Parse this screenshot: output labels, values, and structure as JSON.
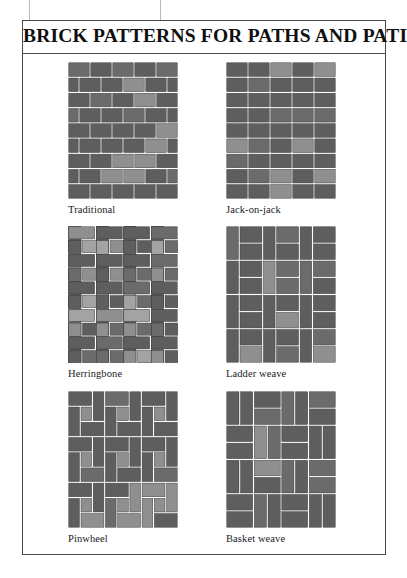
{
  "figure": {
    "title": "BRICK PATTERNS FOR PATHS AND PATIOS",
    "border_color": "#4a4a4a",
    "background_color": "#ffffff"
  },
  "palette": {
    "brick_dark": "#5e5e5e",
    "brick_mid": "#6b6b6b",
    "brick_light": "#8f8f8f",
    "brick_pale": "#a3a3a3",
    "mortar": "#ffffff",
    "brick_outline": "#3c3c3c",
    "label_text": "#1a1a1a",
    "title_text": "#101010"
  },
  "patterns": [
    {
      "id": "traditional",
      "label": "Traditional",
      "type": "running-bond",
      "columns": 5,
      "rows": 9,
      "description": "Half-lap running bond; each course offset by half a brick."
    },
    {
      "id": "jack-on-jack",
      "label": "Jack-on-jack",
      "type": "stack-bond",
      "columns": 5,
      "rows": 9,
      "description": "Stacked bond; bricks aligned in straight columns and rows."
    },
    {
      "id": "herringbone",
      "label": "Herringbone",
      "type": "herringbone",
      "unit_bricks": 2,
      "description": "Bricks laid at right angles in an interlocking zigzag."
    },
    {
      "id": "ladder-weave",
      "label": "Ladder weave",
      "type": "ladder-weave",
      "columns": 3,
      "rows": 4,
      "description": "Single vertical brick alternating with two stacked horizontal bricks."
    },
    {
      "id": "pinwheel",
      "label": "Pinwheel",
      "type": "pinwheel",
      "units_across": 3,
      "units_down": 3,
      "description": "Four bricks rotating around a small square centre brick."
    },
    {
      "id": "basket-weave",
      "label": "Basket weave",
      "type": "basket-weave",
      "units_across": 4,
      "units_down": 4,
      "description": "Alternating blocks of two vertical and two horizontal bricks."
    }
  ]
}
